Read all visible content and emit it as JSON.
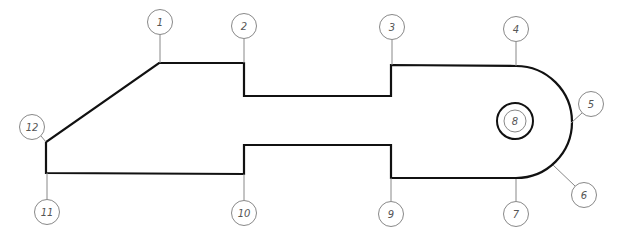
{
  "diagram": {
    "type": "numbered-outline",
    "stroke_color": "#111111",
    "leader_color": "#888888",
    "label_color": "#555555",
    "outline_points": [
      [
        159,
        63
      ],
      [
        244,
        63
      ],
      [
        244,
        96
      ],
      [
        391,
        96
      ],
      [
        391,
        65
      ],
      [
        516,
        66
      ],
      [
        516,
        178
      ],
      [
        391,
        178
      ],
      [
        391,
        145
      ],
      [
        244,
        145
      ],
      [
        244,
        174
      ],
      [
        46,
        173
      ],
      [
        46,
        142
      ]
    ],
    "hole": {
      "cx": 515,
      "cy": 121,
      "r": 18,
      "label": "8"
    },
    "callouts": [
      {
        "label": "1",
        "cx": 160,
        "cy": 22,
        "x1": 160,
        "y1": 35,
        "x2": 160,
        "y2": 63
      },
      {
        "label": "2",
        "cx": 244,
        "cy": 26,
        "x1": 244,
        "y1": 39,
        "x2": 244,
        "y2": 63
      },
      {
        "label": "3",
        "cx": 392,
        "cy": 27,
        "x1": 392,
        "y1": 40,
        "x2": 392,
        "y2": 65
      },
      {
        "label": "4",
        "cx": 516,
        "cy": 29,
        "x1": 516,
        "y1": 42,
        "x2": 516,
        "y2": 66
      },
      {
        "label": "5",
        "cx": 591,
        "cy": 104,
        "x1": 582,
        "y1": 113,
        "x2": 571,
        "y2": 123
      },
      {
        "label": "6",
        "cx": 584,
        "cy": 195,
        "x1": 575,
        "y1": 186,
        "x2": 553,
        "y2": 165
      },
      {
        "label": "7",
        "cx": 516,
        "cy": 214,
        "x1": 516,
        "y1": 201,
        "x2": 516,
        "y2": 179
      },
      {
        "label": "9",
        "cx": 391,
        "cy": 214,
        "x1": 391,
        "y1": 201,
        "x2": 391,
        "y2": 178
      },
      {
        "label": "10",
        "cx": 244,
        "cy": 213,
        "x1": 244,
        "y1": 200,
        "x2": 244,
        "y2": 174
      },
      {
        "label": "11",
        "cx": 47,
        "cy": 212,
        "x1": 47,
        "y1": 199,
        "x2": 47,
        "y2": 173
      },
      {
        "label": "12",
        "cx": 32,
        "cy": 127,
        "x1": 41,
        "y1": 136,
        "x2": 46,
        "y2": 142
      }
    ]
  }
}
